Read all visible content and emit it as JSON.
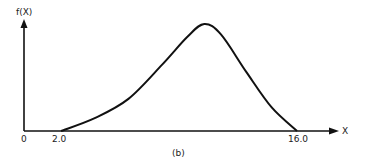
{
  "chart_data": {
    "type": "line",
    "title": "",
    "caption": "(b)",
    "xlabel": "X",
    "ylabel": "f(X)",
    "x_ticks": [
      "0",
      "2.0",
      "16.0"
    ],
    "xlim": [
      0,
      18.5
    ],
    "grid": false,
    "legend": null,
    "series": [
      {
        "name": "f(X)",
        "description": "Skewed unimodal density, zero at X=2.0, peaks near X=10.5, returns to zero at X=16.0",
        "x": [
          2.0,
          4.0,
          6.0,
          8.0,
          9.5,
          10.5,
          11.5,
          13.0,
          14.5,
          16.0
        ],
        "y_relative": [
          0.0,
          0.12,
          0.3,
          0.62,
          0.88,
          1.0,
          0.9,
          0.55,
          0.22,
          0.0
        ]
      }
    ]
  },
  "labels": {
    "y_axis": "f(X)",
    "x_axis": "X",
    "origin": "0",
    "tick_start": "2.0",
    "tick_end": "16.0",
    "caption": "(b)"
  }
}
